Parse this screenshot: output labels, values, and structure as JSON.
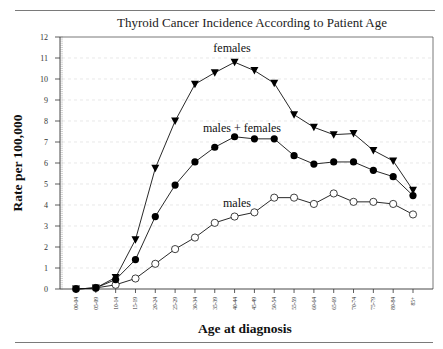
{
  "chart_data": {
    "type": "line",
    "title": "Thyroid Cancer Incidence According to Patient Age",
    "xlabel": "Age at diagnosis",
    "ylabel": "Rate per 100,000",
    "ylim": [
      0,
      12
    ],
    "yticks": [
      0,
      1,
      2,
      3,
      4,
      5,
      6,
      7,
      8,
      9,
      10,
      11,
      12
    ],
    "grid": true,
    "legend": "inline annotations",
    "categories": [
      "00-04",
      "05-09",
      "10-14",
      "15-19",
      "20-24",
      "25-29",
      "30-34",
      "35-39",
      "40-44",
      "45-49",
      "50-54",
      "55-59",
      "60-64",
      "65-69",
      "70-74",
      "75-79",
      "80-84",
      "85+"
    ],
    "series": [
      {
        "name": "females",
        "marker": "filled-triangle-down",
        "values": [
          0.0,
          0.05,
          0.55,
          2.35,
          5.75,
          8.0,
          9.75,
          10.3,
          10.8,
          10.4,
          9.8,
          8.3,
          7.7,
          7.35,
          7.4,
          6.6,
          6.1,
          4.7
        ]
      },
      {
        "name": "males + females",
        "marker": "filled-circle",
        "values": [
          0.0,
          0.05,
          0.45,
          1.4,
          3.45,
          4.95,
          6.05,
          6.75,
          7.25,
          7.15,
          7.15,
          6.35,
          5.95,
          6.05,
          6.05,
          5.65,
          5.35,
          4.45
        ]
      },
      {
        "name": "males",
        "marker": "open-circle",
        "values": [
          0.0,
          0.05,
          0.2,
          0.5,
          1.2,
          1.9,
          2.45,
          3.15,
          3.45,
          3.65,
          4.35,
          4.35,
          4.05,
          4.55,
          4.15,
          4.15,
          4.05,
          3.55
        ]
      }
    ],
    "annotations": [
      {
        "text": "females",
        "series": 0
      },
      {
        "text": "males + females",
        "series": 1
      },
      {
        "text": "males",
        "series": 2
      }
    ]
  }
}
